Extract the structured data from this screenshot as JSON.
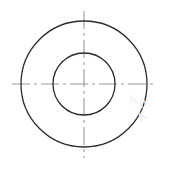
{
  "drawing": {
    "title": "Concentric Circles Technical Drawing",
    "description": "Engineering drawing of an annulus (washer) shown as two concentric circles with dash-dot centerlines",
    "canvas": {
      "width": 169,
      "height": 174,
      "background_color": "#ffffff"
    },
    "center": {
      "x": 84,
      "y": 84,
      "label": "center"
    },
    "shapes": [
      {
        "name": "outer-circle",
        "type": "circle",
        "cx": 84,
        "cy": 84,
        "r": 63,
        "stroke_color": "#2b2b2b",
        "stroke_width": 1.3,
        "fill": "none"
      },
      {
        "name": "inner-circle",
        "type": "circle",
        "cx": 84,
        "cy": 84,
        "r": 31,
        "stroke_color": "#2b2b2b",
        "stroke_width": 1.3,
        "fill": "none"
      }
    ],
    "centerlines": [
      {
        "name": "horizontal-centerline",
        "type": "line",
        "x1": 12,
        "y1": 84,
        "x2": 156,
        "y2": 84,
        "stroke_color": "#9a9a9a",
        "stroke_width": 1.1,
        "dash_pattern": "18 4 3 4"
      },
      {
        "name": "vertical-centerline",
        "type": "line",
        "x1": 84,
        "y1": 11,
        "x2": 84,
        "y2": 158,
        "stroke_color": "#9a9a9a",
        "stroke_width": 1.1,
        "dash_pattern": "18 4 3 4"
      }
    ],
    "watermarks": [
      {
        "name": "watermark-1",
        "text": "A",
        "x": 128,
        "y": 92,
        "rotation": -20
      },
      {
        "name": "watermark-2",
        "text": "0",
        "x": 140,
        "y": 96,
        "rotation": -20
      },
      {
        "name": "watermark-3",
        "text": "K",
        "x": 138,
        "y": 108,
        "rotation": -20
      }
    ]
  }
}
